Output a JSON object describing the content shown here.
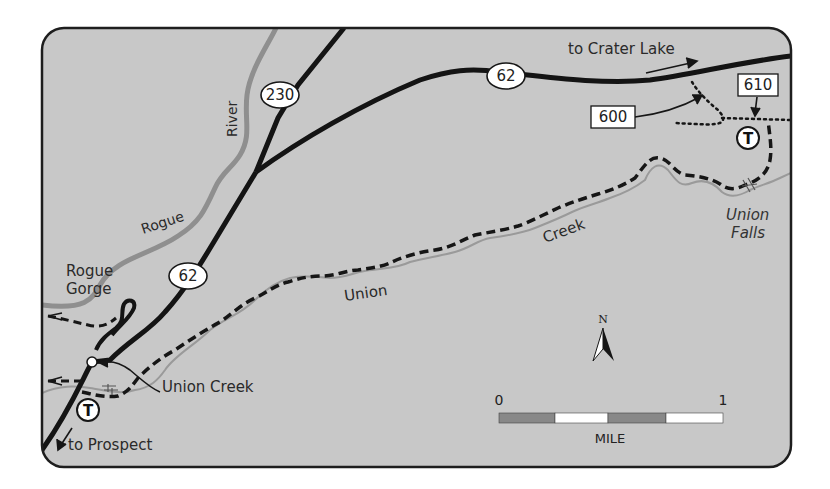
{
  "map": {
    "colors": {
      "land": "#c8c8c8",
      "border": "#1e1e1e",
      "road": "#141414",
      "river": "#8f8f8f",
      "creek": "#9a9a9a",
      "trail": "#161616",
      "scale_dark": "#888888",
      "scale_light": "#ffffff"
    },
    "highway_shields": [
      {
        "id": "hwy-230",
        "label": "230"
      },
      {
        "id": "hwy-62-north",
        "label": "62"
      },
      {
        "id": "hwy-62-south",
        "label": "62"
      }
    ],
    "trail_markers": [
      {
        "id": "trail-610",
        "label": "610"
      },
      {
        "id": "trail-600",
        "label": "600"
      }
    ],
    "trailheads": [
      {
        "id": "trailhead-east",
        "symbol": "T"
      },
      {
        "id": "trailhead-west",
        "symbol": "T"
      }
    ],
    "labels": {
      "to_crater_lake": "to Crater Lake",
      "to_prospect": "to Prospect",
      "river_word1": "Rogue",
      "river_word2": "River",
      "gorge_line1": "Rogue",
      "gorge_line2": "Gorge",
      "union_creek_place": "Union Creek",
      "creek_word1": "Union",
      "creek_word2": "Creek",
      "falls_line1": "Union",
      "falls_line2": "Falls"
    },
    "north_arrow": {
      "label": "N"
    },
    "scale_bar": {
      "start_label": "0",
      "end_label": "1",
      "unit_label": "MILE",
      "segments": 4
    }
  }
}
